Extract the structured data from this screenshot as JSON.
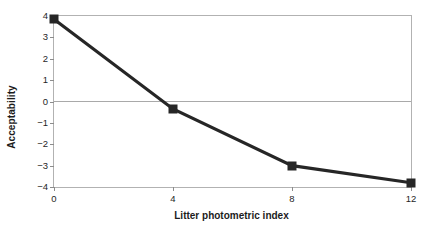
{
  "chart_data": {
    "type": "line",
    "title": "",
    "xlabel": "Litter photometric index",
    "ylabel": "Acceptability",
    "x": [
      0,
      4,
      8,
      12
    ],
    "values": [
      3.85,
      -0.35,
      -3.0,
      -3.8
    ],
    "series": [
      {
        "name": "Acceptability",
        "values": [
          3.85,
          -0.35,
          -3.0,
          -3.8
        ]
      }
    ],
    "xlim": [
      0,
      12
    ],
    "ylim": [
      -4,
      4
    ],
    "xticks": [
      "0",
      "4",
      "8",
      "12"
    ],
    "yticks": [
      "4",
      "3",
      "2",
      "1",
      "0",
      "−1",
      "−2",
      "−3",
      "−4"
    ],
    "ytick_values": [
      4,
      3,
      2,
      1,
      0,
      -1,
      -2,
      -3,
      -4
    ],
    "grid": false,
    "zero_line": true,
    "legend": null,
    "marker": "square",
    "colors": {
      "line": "#262626",
      "marker": "#262626",
      "frame": "#b2b2b2",
      "zero_line": "#a9a9a9",
      "text": "#1c1c1c",
      "background": "#ffffff"
    }
  }
}
